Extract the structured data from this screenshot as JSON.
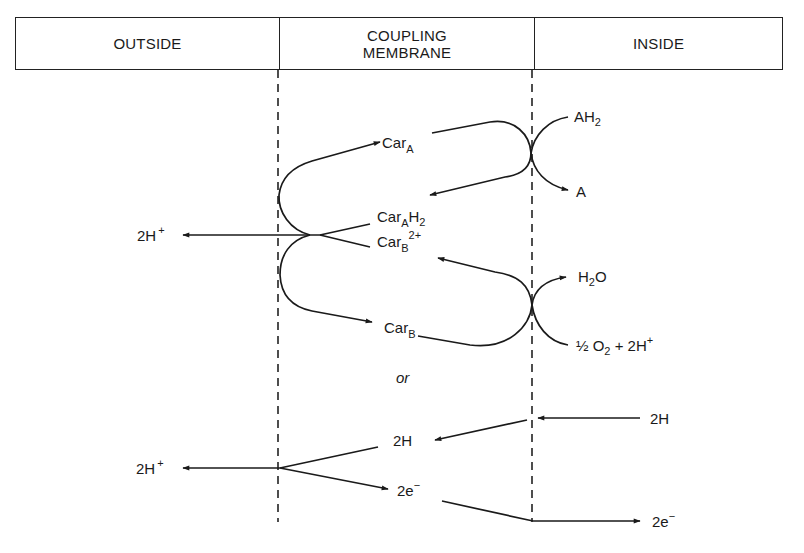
{
  "header": {
    "outside": "OUTSIDE",
    "membrane_line1": "COUPLING",
    "membrane_line2": "MEMBRANE",
    "inside": "INSIDE"
  },
  "labels": {
    "carA": {
      "base": "Car",
      "sub": "A"
    },
    "carAH2": {
      "base": "Car",
      "sub": "A",
      "tail": "H",
      "tail_sub": "2"
    },
    "carB2plus": {
      "base": "Car",
      "sub": "B",
      "sup": "2+"
    },
    "carB": {
      "base": "Car",
      "sub": "B"
    },
    "AH2": {
      "base": "AH",
      "sub": "2"
    },
    "A": "A",
    "H2O": {
      "a": "H",
      "sub": "2",
      "b": "O"
    },
    "half_O2": {
      "a": "½ O",
      "sub": "2",
      "b": " + 2H",
      "sup": "+"
    },
    "twoHplus_top": {
      "base": "2H",
      "sup": "+"
    },
    "or": "or",
    "twoH_inside": "2H",
    "twoH_membrane": "2H",
    "twoHplus_bottom": {
      "base": "2H",
      "sup": "+"
    },
    "two_e_membrane": {
      "base": "2e",
      "sup": "−"
    },
    "two_e_inside": {
      "base": "2e",
      "sup": "−"
    }
  },
  "colors": {
    "ink": "#1a1a1a",
    "background": "#ffffff"
  }
}
